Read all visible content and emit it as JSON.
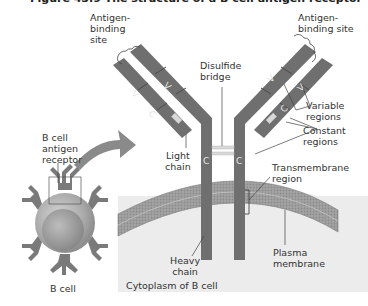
{
  "figure": {
    "title": "Figure 43.9 The structure of a B cell antigen receptor"
  },
  "labels": {
    "antigen_binding_left": "Antigen-\nbinding\nsite",
    "antigen_binding_right": "Antigen-\nbinding site",
    "disulfide_bridge": "Disulfide\nbridge",
    "variable_regions": "Variable\nregions",
    "constant_regions": "Constant\nregions",
    "light_chain": "Light\nchain",
    "transmembrane_region": "Transmembrane\nregion",
    "heavy_chain": "Heavy\nchain",
    "plasma_membrane": "Plasma\nmembrane",
    "cytoplasm": "Cytoplasm of B cell",
    "b_cell_antigen_receptor": "B cell\nantigen\nreceptor",
    "b_cell": "B cell"
  },
  "segments": {
    "variable": "V",
    "constant": "C"
  },
  "colors": {
    "chain": "#6f6f6f",
    "chain_dark": "#5a5a5a",
    "membrane": "#9a9a9a",
    "cytoplasm": "#ececec",
    "cell_body": "#b8b8b8",
    "arrow": "#8a8a8a",
    "bridge": "#d8d8d8",
    "text": "#333333"
  }
}
